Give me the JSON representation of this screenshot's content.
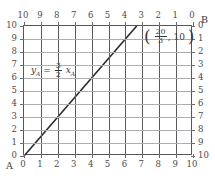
{
  "figure": {
    "axis_A_name": "A",
    "axis_B_name": "B",
    "equation": {
      "lhs": "y",
      "lhs_sub": "A",
      "eq": "=",
      "num": "3",
      "den": "2",
      "rhs": "x",
      "rhs_sub": "A"
    },
    "point_label": {
      "open": "(",
      "num": "20",
      "den": "3",
      "comma": ",",
      "y": "10",
      "close": ")"
    }
  },
  "chart_data": {
    "type": "line",
    "title": "",
    "xlabel": "A",
    "ylabel": "A",
    "grid": true,
    "legend": "none",
    "xlim": [
      0,
      10
    ],
    "ylim": [
      0,
      10
    ],
    "bottom_axis_ticks": [
      "0",
      "1",
      "2",
      "3",
      "4",
      "5",
      "6",
      "7",
      "8",
      "9",
      "10"
    ],
    "left_axis_ticks": [
      "10",
      "9",
      "8",
      "7",
      "6",
      "5",
      "4",
      "3",
      "2",
      "1",
      "0"
    ],
    "top_axis_ticks": [
      "10",
      "9",
      "8",
      "7",
      "6",
      "5",
      "4",
      "3",
      "2",
      "1",
      "0"
    ],
    "right_axis_ticks": [
      "0",
      "1",
      "2",
      "3",
      "4",
      "5",
      "6",
      "7",
      "8",
      "9",
      "10"
    ],
    "series": [
      {
        "name": "y_A = (3/2) x_A",
        "slope": 1.5,
        "intercept": 0,
        "x": [
          0,
          6.6667
        ],
        "y": [
          0,
          10
        ]
      }
    ],
    "annotations": [
      {
        "text": "y_A = (3/2) x_A",
        "x": 1.2,
        "y": 7.0
      },
      {
        "text": "(20/3, 10)",
        "x": 7.7,
        "y": 9.4
      }
    ]
  }
}
